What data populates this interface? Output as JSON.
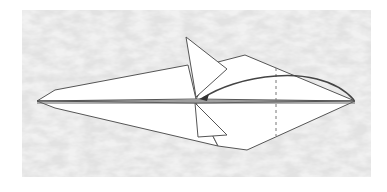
{
  "diagram": {
    "type": "origami-step",
    "colors": {
      "background_texture": "#e4e4e4",
      "paper": "#ffffff",
      "line": "#555555",
      "arrow": "#444444",
      "dashed": "#777777"
    },
    "elements": [
      {
        "name": "origami-model",
        "description": "diamond-shaped folded paper with two small flaps"
      },
      {
        "name": "fold-arrow",
        "description": "curved arrow from right tip to center"
      },
      {
        "name": "valley-fold-line",
        "description": "vertical dashed fold line"
      }
    ]
  }
}
